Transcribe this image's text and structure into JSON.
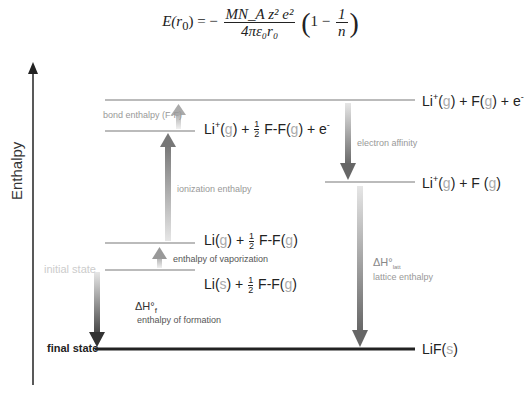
{
  "formula": {
    "lhs": "E(r",
    "lhs_sub": "0",
    "lhs_end": ") = −",
    "numerator": "MN_A z² e²",
    "denominator": "4πε₀r₀",
    "paren_text": "1 −",
    "inner_num": "1",
    "inner_den": "n"
  },
  "axis": {
    "label": "Enthalpy"
  },
  "levels": {
    "top_right": {
      "li": "Li",
      "sup": "+",
      "g1": "g",
      "plus_f": ") + F(",
      "g2": "g",
      "tail": ") + e",
      "esup": "-"
    },
    "ionized": {
      "li": "Li",
      "sup": "+",
      "g1": "g",
      "plus": ") + ",
      "ff": "F-F(",
      "g2": "g",
      "tail": ") + e",
      "esup": "-"
    },
    "ions_gas": {
      "li": "Li",
      "sup": "+",
      "g1": "g",
      "plus_f": ") + F (",
      "g2": "g",
      "tail": ")"
    },
    "li_gas": {
      "li": "Li(",
      "g1": "g",
      "plus": ") + ",
      "ff": "F-F(",
      "g2": "g",
      "tail": ")"
    },
    "initial": {
      "label": "initial state",
      "li": "Li(",
      "s": "s",
      "plus": ") + ",
      "ff": "F-F(",
      "g2": "g",
      "tail": ")"
    },
    "final": {
      "label": "final state",
      "lif": "LiF(",
      "s": "s",
      "tail": ")"
    }
  },
  "half": {
    "num": "1",
    "den": "2"
  },
  "steps": {
    "bond": "bond enthalpy (F-F)",
    "ionization": "ionization enthalpy",
    "vaporization": "enthalpy of vaporization",
    "formation_symbol": "ΔH°",
    "formation_sub": "f",
    "formation": "enthalpy of formation",
    "affinity": "electron affinity",
    "lattice_symbol": "ΔH°",
    "lattice_sub": "latt",
    "lattice": "lattice enthalpy"
  },
  "colors": {
    "level": "#bbbbbb",
    "final": "#222222",
    "arrow_dark": "#555555",
    "arrow_light": "#dddddd"
  }
}
